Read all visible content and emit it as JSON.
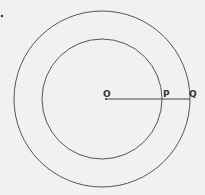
{
  "diagram": {
    "type": "concentric-circles",
    "center": {
      "label": "O",
      "x": 106,
      "y": 99
    },
    "circles": [
      {
        "name": "outer-circle",
        "cx": 102,
        "cy": 99,
        "r": 88
      },
      {
        "name": "inner-circle",
        "cx": 102,
        "cy": 99,
        "r": 60
      }
    ],
    "points": [
      {
        "label": "O",
        "x": 106,
        "y": 99
      },
      {
        "label": "P",
        "x": 161,
        "y": 99
      },
      {
        "label": "Q",
        "x": 190,
        "y": 99
      }
    ],
    "segment": {
      "from": "O",
      "to": "Q"
    },
    "stroke_color": "#555555",
    "background": "#f1f1ef"
  }
}
